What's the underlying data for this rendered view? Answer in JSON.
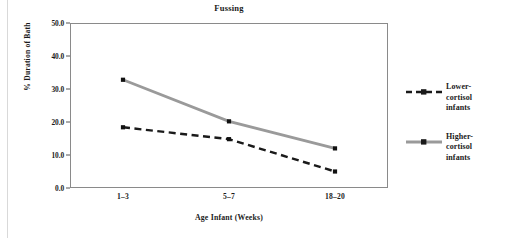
{
  "figure": {
    "background": "#ffffff",
    "frame_color": "#8a8a8a"
  },
  "chart_data": {
    "type": "line",
    "title": "Fussing",
    "xlabel": "Age Infant (Weeks)",
    "ylabel": "% Duration of Bath",
    "categories": [
      "1–3",
      "5–7",
      "18–20"
    ],
    "ylim": [
      0.0,
      50.0
    ],
    "yticks": [
      "0.0",
      "10.0",
      "20.0",
      "30.0",
      "40.0",
      "50.0"
    ],
    "ytick_values": [
      0.0,
      10.0,
      20.0,
      30.0,
      40.0,
      50.0
    ],
    "grid": false,
    "legend_position": "right",
    "series": [
      {
        "name": "Lower-cortisol infants",
        "values": [
          18.4,
          14.8,
          5.0
        ],
        "color": "#1a1a1a",
        "style": "dashed",
        "marker": "square"
      },
      {
        "name": "Higher-cortisol infants",
        "values": [
          32.8,
          20.2,
          12.0
        ],
        "color": "#9a9a9a",
        "style": "solid",
        "marker": "square"
      }
    ]
  },
  "legend": {
    "entries": [
      {
        "label": "Lower-\ncortisol\ninfants",
        "line1": "Lower-",
        "line2": "cortisol",
        "line3": "infants"
      },
      {
        "label": "Higher-\ncortisol\ninfants",
        "line1": "Higher-",
        "line2": "cortisol",
        "line3": "infants"
      }
    ]
  }
}
